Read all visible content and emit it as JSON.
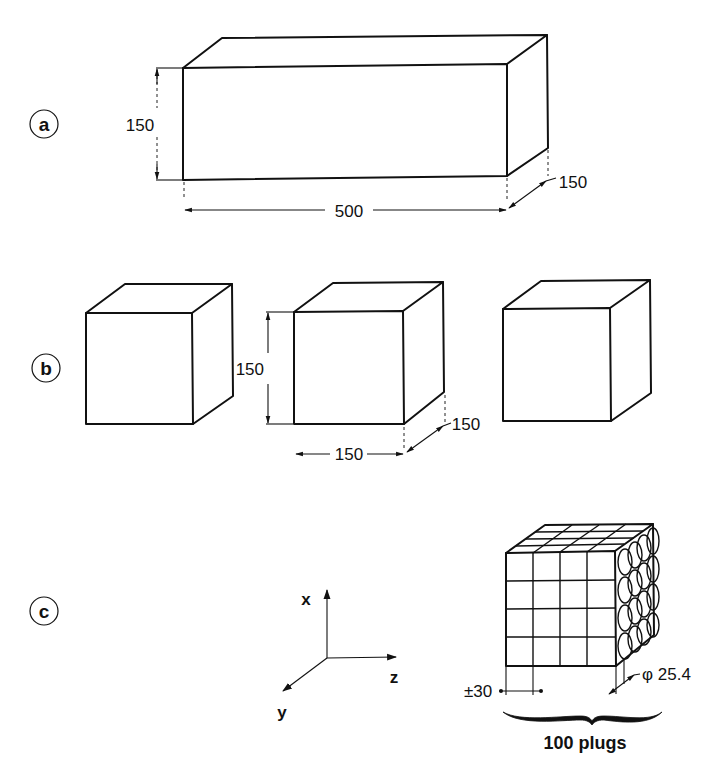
{
  "figure": {
    "colors": {
      "line": "#111111",
      "background": "#ffffff"
    }
  },
  "panels": [
    {
      "id": "a",
      "label": "a",
      "shape": "rectangular prism",
      "dimensions": {
        "height": "150",
        "length": "500",
        "depth": "150"
      }
    },
    {
      "id": "b",
      "label": "b",
      "shape": "three cubes",
      "dimensions": {
        "height": "150",
        "width": "150",
        "depth": "150"
      }
    },
    {
      "id": "c",
      "label": "c",
      "shape": "block with cored plugs",
      "axes": {
        "x": "x",
        "y": "y",
        "z": "z"
      },
      "dimensions": {
        "spacing": "±30",
        "diameter": "φ 25.4"
      },
      "caption": "100 plugs"
    }
  ]
}
